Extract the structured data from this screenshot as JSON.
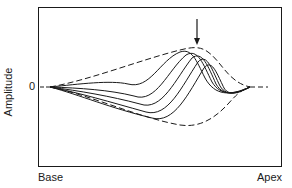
{
  "figure": {
    "y_axis_label": "Amplitude",
    "zero_label": "0",
    "x_left_label": "Base",
    "x_right_label": "Apex",
    "colors": {
      "line": "#1a1a1a",
      "background": "#ffffff"
    },
    "annotation": "arrow-marking-envelope-peak",
    "curves": {
      "envelope": "dashed upper and lower envelope, rising from base to a peak near the arrow then collapsing to zero toward apex",
      "waveforms": 5
    }
  }
}
